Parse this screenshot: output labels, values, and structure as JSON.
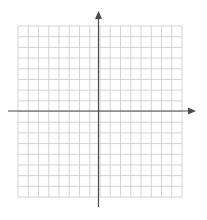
{
  "diagram": {
    "type": "coordinate-plane",
    "grid": {
      "columns": 16,
      "rows": 16,
      "left": 18,
      "top": 26,
      "right": 182,
      "bottom": 197,
      "line_color": "#c9c9c9"
    },
    "axes": {
      "color": "#4a4a4a",
      "x_axis": {
        "y": 111,
        "x_start": 8,
        "x_end": 196,
        "arrow": "right"
      },
      "y_axis": {
        "x": 98.5,
        "y_start": 207,
        "y_end": 11,
        "arrow": "up"
      }
    },
    "labels": []
  }
}
